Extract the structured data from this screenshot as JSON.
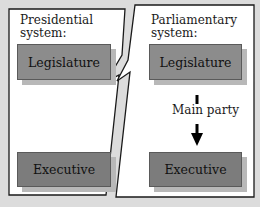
{
  "left_panel": {
    "title_line1": "Presidential",
    "title_line2": "system:",
    "boxes": [
      {
        "label": "Legislature"
      },
      {
        "label": "Executive"
      }
    ]
  },
  "right_panel": {
    "title_line1": "Parliamentary",
    "title_line2": "system:",
    "boxes": [
      {
        "label": "Legislature"
      },
      {
        "label": "Executive"
      }
    ],
    "connector_label": "Main party"
  },
  "colors": {
    "background": "#dcdcdc",
    "panel": "#ffffff",
    "box": "#8c8c8c",
    "box_shadow": "#b8b8b8",
    "outline": "#1a1a1a"
  }
}
